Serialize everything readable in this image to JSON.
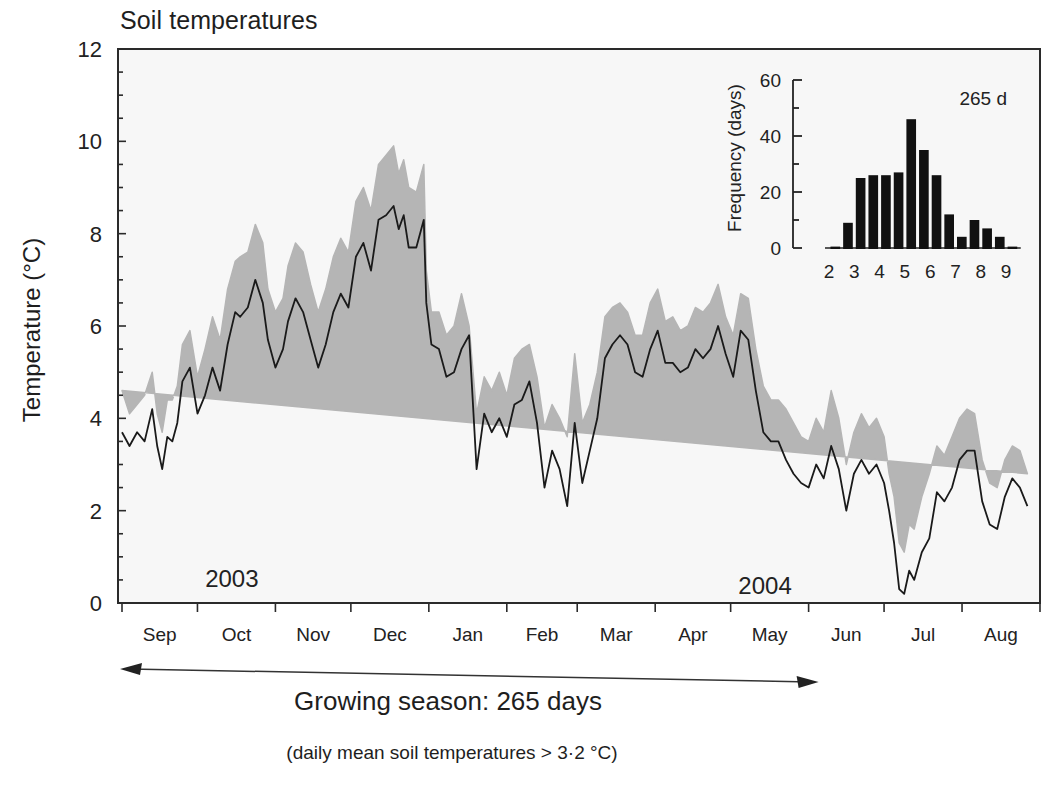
{
  "chart_data": [
    {
      "type": "line",
      "title": "Soil temperatures",
      "xlabel": "",
      "ylabel": "Temperature (°C)",
      "ylim": [
        0,
        12
      ],
      "yticks": [
        0,
        2,
        4,
        6,
        8,
        10,
        12
      ],
      "y_minor_step": 0.5,
      "grid": false,
      "x_range_days": [
        0,
        365
      ],
      "month_ticks_day": [
        0,
        30,
        61,
        91,
        122,
        153,
        181,
        212,
        242,
        273,
        303,
        334,
        365
      ],
      "month_labels": [
        "Sep",
        "Oct",
        "Nov",
        "Dec",
        "Jan",
        "Feb",
        "Mar",
        "Apr",
        "May",
        "Jun",
        "Jul",
        "Aug"
      ],
      "year_annotations": [
        {
          "label": "2003",
          "day": 45,
          "value": 0.35
        },
        {
          "label": "2004",
          "day": 257,
          "value": 0.2
        }
      ],
      "series": [
        {
          "name": "Daily mean soil temperature",
          "style": "line",
          "color": "#1a1a1a",
          "x": [
            0,
            3,
            6,
            9,
            12,
            14,
            16,
            18,
            20,
            22,
            24,
            27,
            30,
            33,
            36,
            39,
            42,
            45,
            47,
            50,
            53,
            56,
            58,
            61,
            64,
            66,
            69,
            72,
            75,
            78,
            81,
            84,
            87,
            90,
            93,
            96,
            99,
            102,
            105,
            108,
            110,
            112,
            114,
            117,
            120,
            121,
            123,
            126,
            129,
            132,
            135,
            138,
            141,
            144,
            147,
            150,
            153,
            156,
            159,
            162,
            165,
            168,
            171,
            174,
            177,
            180,
            183,
            186,
            189,
            192,
            195,
            198,
            201,
            204,
            207,
            210,
            213,
            216,
            219,
            222,
            225,
            228,
            231,
            234,
            237,
            240,
            243,
            246,
            249,
            252,
            255,
            258,
            261,
            264,
            267,
            270,
            273,
            276,
            279,
            282,
            285,
            288,
            291,
            294,
            297,
            300,
            303,
            305,
            307,
            309,
            311,
            313,
            315,
            318,
            321,
            324,
            327,
            330,
            333,
            336,
            339,
            342,
            345,
            348,
            351,
            354,
            357,
            360,
            363,
            365
          ],
          "values": [
            3.7,
            3.4,
            3.7,
            3.5,
            4.2,
            3.4,
            2.9,
            3.6,
            3.5,
            3.9,
            4.8,
            5.1,
            4.1,
            4.5,
            5.1,
            4.6,
            5.6,
            6.3,
            6.2,
            6.4,
            7.0,
            6.5,
            5.7,
            5.1,
            5.5,
            6.1,
            6.6,
            6.3,
            5.7,
            5.1,
            5.6,
            6.3,
            6.7,
            6.4,
            7.5,
            7.8,
            7.2,
            8.3,
            8.4,
            8.6,
            8.1,
            8.4,
            7.7,
            7.7,
            8.3,
            6.5,
            5.6,
            5.5,
            4.9,
            5.0,
            5.5,
            5.8,
            2.9,
            4.1,
            3.7,
            4.0,
            3.6,
            4.3,
            4.4,
            4.8,
            3.9,
            2.5,
            3.3,
            2.9,
            2.1,
            3.9,
            2.6,
            3.3,
            4.0,
            5.3,
            5.6,
            5.8,
            5.6,
            5.0,
            4.9,
            5.5,
            5.9,
            5.2,
            5.2,
            5.0,
            5.1,
            5.5,
            5.3,
            5.5,
            6.0,
            5.4,
            4.9,
            5.9,
            5.7,
            4.6,
            3.7,
            3.5,
            3.5,
            3.1,
            2.8,
            2.6,
            2.5,
            3.0,
            2.7,
            3.4,
            2.9,
            2.0,
            2.8,
            3.1,
            2.8,
            3.0,
            2.6,
            2.0,
            1.3,
            0.3,
            0.2,
            0.7,
            0.5,
            1.1,
            1.4,
            2.4,
            2.2,
            2.5,
            3.1,
            3.3,
            3.3,
            2.2,
            1.7,
            1.6,
            2.3,
            2.7,
            2.5,
            2.1
          ],
          "band": {
            "name": "Range (min–max)",
            "color": "#b5b5b5",
            "upper": [
              4.6,
              4.1,
              4.3,
              4.5,
              5.0,
              4.1,
              3.7,
              4.4,
              4.4,
              4.7,
              5.6,
              5.9,
              4.9,
              5.5,
              6.2,
              5.7,
              6.8,
              7.4,
              7.5,
              7.6,
              8.2,
              7.8,
              6.8,
              6.3,
              6.6,
              7.3,
              7.8,
              7.6,
              6.9,
              6.3,
              6.8,
              7.5,
              7.9,
              7.6,
              8.7,
              9.0,
              8.5,
              9.5,
              9.7,
              9.9,
              9.3,
              9.6,
              9.0,
              8.9,
              9.5,
              7.2,
              6.3,
              6.3,
              5.8,
              6.0,
              6.7,
              6.0,
              4.1,
              4.9,
              4.6,
              5.0,
              4.5,
              5.3,
              5.5,
              5.6,
              4.9,
              3.8,
              4.3,
              4.0,
              3.6,
              5.4,
              3.9,
              4.3,
              5.0,
              6.2,
              6.4,
              6.5,
              6.3,
              5.8,
              5.8,
              6.5,
              6.8,
              6.1,
              6.2,
              5.9,
              6.0,
              6.4,
              6.3,
              6.5,
              6.9,
              6.2,
              5.8,
              6.7,
              6.6,
              5.5,
              4.7,
              4.4,
              4.4,
              4.2,
              3.9,
              3.6,
              3.5,
              4.0,
              3.7,
              4.6,
              4.0,
              3.0,
              3.7,
              4.1,
              3.8,
              4.0,
              3.6,
              2.8,
              2.3,
              1.3,
              1.1,
              1.7,
              1.6,
              2.3,
              2.8,
              3.4,
              3.2,
              3.6,
              4.0,
              4.2,
              4.1,
              3.1,
              2.6,
              2.5,
              3.1,
              3.4,
              3.3,
              2.8
            ],
            "lower": [
              2.8,
              2.5,
              2.6,
              2.4,
              3.2,
              2.2,
              1.8,
              2.6,
              2.6,
              2.9,
              3.9,
              4.2,
              3.1,
              3.3,
              4.0,
              3.4,
              4.3,
              5.2,
              4.8,
              5.2,
              5.8,
              5.2,
              4.5,
              3.9,
              4.3,
              4.8,
              5.4,
              5.0,
              4.4,
              3.9,
              4.4,
              5.1,
              5.5,
              5.2,
              6.3,
              6.6,
              6.0,
              7.1,
              7.2,
              7.4,
              6.9,
              7.2,
              6.5,
              6.6,
              7.2,
              3.3,
              4.9,
              4.7,
              4.0,
              4.1,
              4.5,
              4.8,
              1.9,
              3.2,
              2.8,
              3.0,
              2.7,
              3.4,
              3.5,
              3.9,
              2.9,
              1.7,
              2.3,
              1.9,
              1.5,
              2.7,
              1.9,
              2.5,
              3.1,
              4.5,
              4.9,
              5.1,
              4.8,
              4.2,
              4.0,
              4.6,
              5.0,
              4.4,
              4.3,
              4.2,
              4.2,
              4.6,
              4.4,
              4.6,
              5.1,
              4.6,
              4.0,
              5.1,
              4.8,
              3.7,
              2.9,
              2.7,
              2.6,
              2.3,
              2.0,
              1.8,
              1.6,
              2.1,
              1.8,
              2.5,
              2.1,
              1.3,
              2.0,
              2.3,
              2.0,
              2.2,
              1.8,
              1.4,
              0.6,
              0.0,
              0.0,
              0.1,
              0.0,
              0.5,
              0.7,
              1.6,
              1.5,
              1.7,
              2.3,
              2.5,
              2.5,
              1.5,
              1.0,
              0.9,
              1.6,
              2.0,
              1.7,
              1.4
            ]
          }
        }
      ],
      "annotations": [
        {
          "type": "double-arrow",
          "from_day": 0,
          "to_day": 273,
          "label": "Growing season: 265 days"
        },
        {
          "type": "note",
          "label": "(daily mean soil temperatures > 3·2 °C)"
        }
      ]
    },
    {
      "type": "bar",
      "title": "Inset histogram",
      "annotation": "265 d",
      "xlabel": "",
      "ylabel": "Frequency (days)",
      "ylim": [
        0,
        60
      ],
      "yticks": [
        0,
        20,
        40,
        60
      ],
      "y_minor_step": 10,
      "xticks": [
        2,
        3,
        4,
        5,
        6,
        7,
        8,
        9
      ],
      "bin_width": 0.5,
      "categories": [
        "2.0-2.5",
        "2.5-3.0",
        "3.0-3.5",
        "3.5-4.0",
        "4.0-4.5",
        "4.5-5.0",
        "5.0-5.5",
        "5.5-6.0",
        "6.0-6.5",
        "6.5-7.0",
        "7.0-7.5",
        "7.5-8.0",
        "8.0-8.5",
        "8.5-9.0",
        "9.0-9.5"
      ],
      "bin_starts": [
        2.0,
        2.5,
        3.0,
        3.5,
        4.0,
        4.5,
        5.0,
        5.5,
        6.0,
        6.5,
        7.0,
        7.5,
        8.0,
        8.5,
        9.0
      ],
      "values": [
        0.5,
        9,
        25,
        26,
        26,
        27,
        46,
        35,
        26,
        12,
        4,
        10,
        7,
        4,
        0.5
      ],
      "color": "#111111"
    }
  ],
  "page": {
    "title": "Soil temperatures",
    "ylabel": "Temperature (°C)",
    "season_label": "Growing season: 265 days",
    "season_note": "(daily mean soil temperatures > 3·2 °C)"
  }
}
